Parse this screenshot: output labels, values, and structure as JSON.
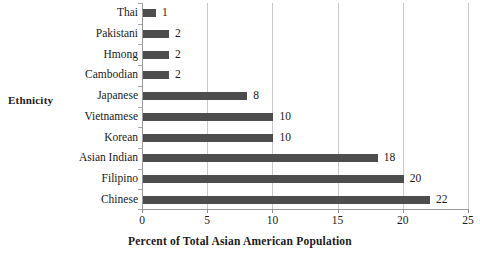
{
  "chart_data": {
    "type": "bar",
    "orientation": "horizontal",
    "title": "",
    "xlabel": "Percent of Total Asian American Population",
    "ylabel": "Ethnicity",
    "categories": [
      "Thai",
      "Pakistani",
      "Hmong",
      "Cambodian",
      "Japanese",
      "Vietnamese",
      "Korean",
      "Asian Indian",
      "Filipino",
      "Chinese"
    ],
    "values": [
      1,
      2,
      2,
      2,
      8,
      10,
      10,
      18,
      20,
      22
    ],
    "value_labels": [
      "1",
      "2",
      "2",
      "2",
      "8",
      "10",
      "10",
      "18",
      "20",
      "22"
    ],
    "xlim": [
      0,
      25
    ],
    "xticks": [
      0,
      5,
      10,
      15,
      20,
      25
    ],
    "xtick_labels": [
      "0",
      "5",
      "10",
      "15",
      "20",
      "25"
    ],
    "grid": "vertical",
    "legend": "none",
    "bar_color": "#4d4d4d",
    "gridline_color": "#c9c9c9",
    "axis_color": "#9a9a9a",
    "background_color": "#ffffff"
  }
}
